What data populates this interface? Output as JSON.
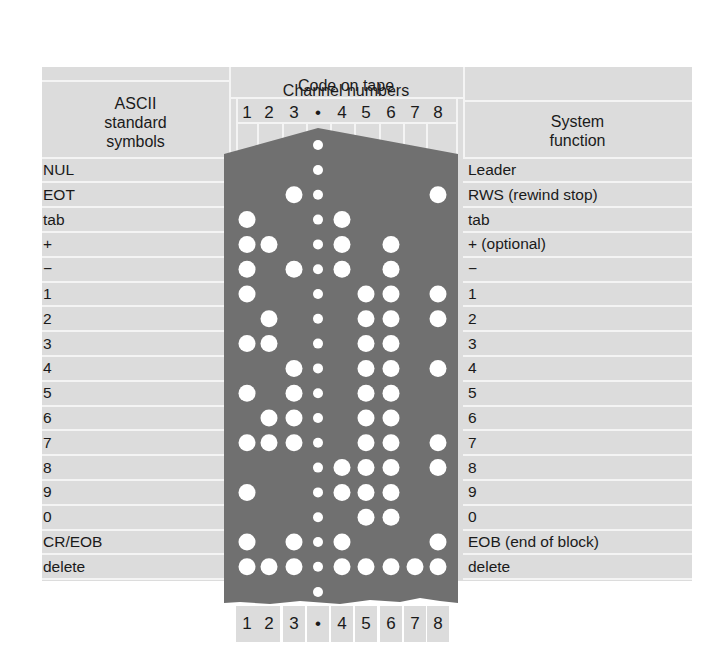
{
  "header": {
    "left_title": [
      "ASCII",
      "standard",
      "symbols"
    ],
    "center_title": "Code on tape",
    "center_subtitle": "Channel numbers",
    "right_title": [
      "System",
      "function"
    ]
  },
  "channels": [
    "1",
    "2",
    "3",
    "•",
    "4",
    "5",
    "6",
    "7",
    "8"
  ],
  "colors": {
    "tape": "#707070",
    "table": "#dcdcdc",
    "grid": "#f4f4f4",
    "hole": "#ffffff"
  },
  "rows": [
    {
      "ascii": "NUL",
      "function": "Leader",
      "holes": []
    },
    {
      "ascii": "EOT",
      "function": "RWS (rewind stop)",
      "holes": [
        3,
        8
      ]
    },
    {
      "ascii": "tab",
      "function": "tab",
      "holes": [
        1,
        4
      ]
    },
    {
      "ascii": "+",
      "function": "+ (optional)",
      "holes": [
        1,
        2,
        4,
        6
      ]
    },
    {
      "ascii": "−",
      "function": "−",
      "holes": [
        1,
        3,
        4,
        6
      ]
    },
    {
      "ascii": "1",
      "function": "1",
      "holes": [
        1,
        5,
        6,
        8
      ]
    },
    {
      "ascii": "2",
      "function": "2",
      "holes": [
        2,
        5,
        6,
        8
      ]
    },
    {
      "ascii": "3",
      "function": "3",
      "holes": [
        1,
        2,
        5,
        6
      ]
    },
    {
      "ascii": "4",
      "function": "4",
      "holes": [
        3,
        5,
        6,
        8
      ]
    },
    {
      "ascii": "5",
      "function": "5",
      "holes": [
        1,
        3,
        5,
        6
      ]
    },
    {
      "ascii": "6",
      "function": "6",
      "holes": [
        2,
        3,
        5,
        6
      ]
    },
    {
      "ascii": "7",
      "function": "7",
      "holes": [
        1,
        2,
        3,
        5,
        6,
        8
      ]
    },
    {
      "ascii": "8",
      "function": "8",
      "holes": [
        4,
        5,
        6,
        8
      ]
    },
    {
      "ascii": "9",
      "function": "9",
      "holes": [
        1,
        4,
        5,
        6
      ]
    },
    {
      "ascii": "0",
      "function": "0",
      "holes": [
        5,
        6
      ]
    },
    {
      "ascii": "CR/EOB",
      "function": "EOB (end of block)",
      "holes": [
        1,
        3,
        4,
        8
      ]
    },
    {
      "ascii": "delete",
      "function": "delete",
      "holes": [
        1,
        2,
        3,
        4,
        5,
        6,
        7,
        8
      ]
    }
  ]
}
